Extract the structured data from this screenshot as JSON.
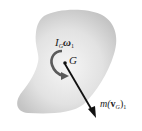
{
  "diagram": {
    "type": "rigid-body-momentum",
    "body": {
      "fill_center": "#f4f4f4",
      "fill_edge": "#c8c8c8"
    },
    "labels": {
      "angular_momentum": {
        "base": "I",
        "base_sub": "G",
        "symbol": "ω",
        "symbol_sub": "1"
      },
      "center_of_mass": "G",
      "linear_momentum": {
        "prefix": "m(",
        "vec": "v",
        "vec_sub": "G",
        "suffix": ")",
        "suffix_sub": "1"
      }
    },
    "colors": {
      "arrow": "#111111",
      "curved_arrow": "#555555",
      "text": "#222222"
    }
  }
}
